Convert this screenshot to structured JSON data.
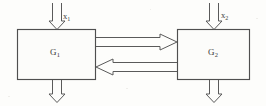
{
  "figure": {
    "type": "block-diagram",
    "background_color": "#fdfdfb",
    "line_color": "#555555",
    "text_color": "#3a3a3a",
    "blocks": [
      {
        "id": "g1",
        "label_base": "G",
        "label_sub": "1",
        "x": 17,
        "y": 29,
        "width": 79,
        "height": 51
      },
      {
        "id": "g2",
        "label_base": "G",
        "label_sub": "2",
        "x": 177,
        "y": 29,
        "width": 73,
        "height": 51
      }
    ],
    "signals": [
      {
        "id": "x1",
        "label_base": "x",
        "label_sub": "1",
        "direction": "down",
        "role": "input-to-g1"
      },
      {
        "id": "x2",
        "label_base": "x",
        "label_sub": "2",
        "direction": "down",
        "role": "input-to-g2"
      },
      {
        "id": "g1-to-g2",
        "label_base": "",
        "label_sub": "",
        "direction": "right",
        "role": "coupling-forward"
      },
      {
        "id": "g2-to-g1",
        "label_base": "",
        "label_sub": "",
        "direction": "left",
        "role": "coupling-feedback"
      },
      {
        "id": "g1-out",
        "label_base": "",
        "label_sub": "",
        "direction": "down",
        "role": "output-of-g1"
      },
      {
        "id": "g2-out",
        "label_base": "",
        "label_sub": "",
        "direction": "down",
        "role": "output-of-g2"
      }
    ]
  }
}
